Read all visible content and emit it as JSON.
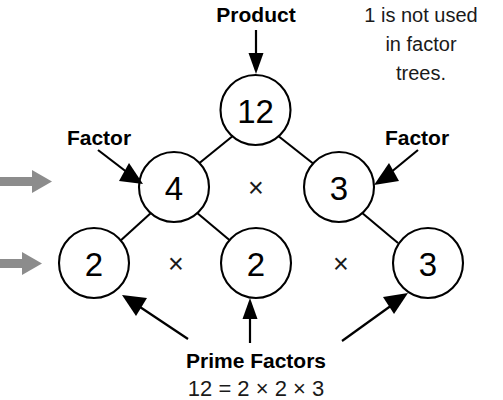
{
  "diagram": {
    "title_concept": "factor-tree",
    "note": {
      "line1": "1 is not used",
      "line2": "in factor",
      "line3": "trees."
    },
    "labels": {
      "product": "Product",
      "factor_left": "Factor",
      "factor_right": "Factor",
      "prime_factors": "Prime Factors"
    },
    "equation": "12 = 2 × 2 × 3",
    "operators": {
      "level2": "×",
      "level3_left": "×",
      "level3_right": "×"
    },
    "nodes": {
      "root": "12",
      "level2_left": "4",
      "level2_right": "3",
      "level3_first": "2",
      "level3_second": "2",
      "level3_third": "3"
    },
    "colors": {
      "ink": "#000000",
      "background": "#ffffff",
      "gray_arrow": "#8c8c8c"
    }
  }
}
